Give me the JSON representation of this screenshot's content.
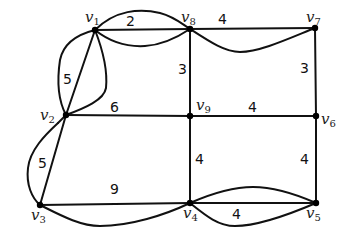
{
  "diagram": {
    "type": "weighted-graph",
    "nodes": [
      {
        "id": "v1",
        "letter": "v",
        "sub": "1",
        "x": 95,
        "y": 30
      },
      {
        "id": "v2",
        "letter": "v",
        "sub": "2",
        "x": 66,
        "y": 115
      },
      {
        "id": "v3",
        "letter": "v",
        "sub": "3",
        "x": 40,
        "y": 205
      },
      {
        "id": "v4",
        "letter": "v",
        "sub": "4",
        "x": 190,
        "y": 203
      },
      {
        "id": "v5",
        "letter": "v",
        "sub": "5",
        "x": 316,
        "y": 203
      },
      {
        "id": "v6",
        "letter": "v",
        "sub": "6",
        "x": 316,
        "y": 116
      },
      {
        "id": "v7",
        "letter": "v",
        "sub": "7",
        "x": 315,
        "y": 28
      },
      {
        "id": "v8",
        "letter": "v",
        "sub": "8",
        "x": 190,
        "y": 29
      },
      {
        "id": "v9",
        "letter": "v",
        "sub": "9",
        "x": 190,
        "y": 116
      }
    ],
    "edges": [
      {
        "from": "v1",
        "to": "v8",
        "weight": "2",
        "style": "straight"
      },
      {
        "from": "v1",
        "to": "v8",
        "weight": "",
        "style": "curve-up"
      },
      {
        "from": "v1",
        "to": "v8",
        "weight": "",
        "style": "curve-down"
      },
      {
        "from": "v8",
        "to": "v7",
        "weight": "4",
        "style": "straight"
      },
      {
        "from": "v8",
        "to": "v7",
        "weight": "",
        "style": "curve-down"
      },
      {
        "from": "v1",
        "to": "v2",
        "weight": "5",
        "style": "straight"
      },
      {
        "from": "v1",
        "to": "v2",
        "weight": "",
        "style": "curve-left"
      },
      {
        "from": "v1",
        "to": "v2",
        "weight": "",
        "style": "curve-right"
      },
      {
        "from": "v2",
        "to": "v9",
        "weight": "6",
        "style": "straight"
      },
      {
        "from": "v9",
        "to": "v6",
        "weight": "4",
        "style": "straight"
      },
      {
        "from": "v8",
        "to": "v9",
        "weight": "3",
        "style": "straight"
      },
      {
        "from": "v7",
        "to": "v6",
        "weight": "3",
        "style": "straight"
      },
      {
        "from": "v2",
        "to": "v3",
        "weight": "5",
        "style": "straight"
      },
      {
        "from": "v2",
        "to": "v3",
        "weight": "",
        "style": "curve-left"
      },
      {
        "from": "v3",
        "to": "v4",
        "weight": "9",
        "style": "straight"
      },
      {
        "from": "v3",
        "to": "v4",
        "weight": "",
        "style": "curve-down"
      },
      {
        "from": "v9",
        "to": "v4",
        "weight": "4",
        "style": "straight"
      },
      {
        "from": "v6",
        "to": "v5",
        "weight": "4",
        "style": "straight"
      },
      {
        "from": "v4",
        "to": "v5",
        "weight": "",
        "style": "straight"
      },
      {
        "from": "v4",
        "to": "v5",
        "weight": "",
        "style": "curve-up"
      },
      {
        "from": "v4",
        "to": "v5",
        "weight": "4",
        "style": "curve-down"
      }
    ],
    "weight_labels": {
      "w_v1v8": "2",
      "w_v8v7": "4",
      "w_v1v2": "5",
      "w_v2v9": "6",
      "w_v9v6": "4",
      "w_v8v9": "3",
      "w_v7v6": "3",
      "w_v2v3": "5",
      "w_v3v4": "9",
      "w_v9v4": "4",
      "w_v6v5": "4",
      "w_v4v5": "4"
    },
    "node_labels": {
      "v1": {
        "letter": "v",
        "sub": "1"
      },
      "v2": {
        "letter": "v",
        "sub": "2"
      },
      "v3": {
        "letter": "v",
        "sub": "3"
      },
      "v4": {
        "letter": "v",
        "sub": "4"
      },
      "v5": {
        "letter": "v",
        "sub": "5"
      },
      "v6": {
        "letter": "v",
        "sub": "6"
      },
      "v7": {
        "letter": "v",
        "sub": "7"
      },
      "v8": {
        "letter": "v",
        "sub": "8"
      },
      "v9": {
        "letter": "v",
        "sub": "9"
      }
    },
    "colors": {
      "edge": "#111111",
      "node": "#000000",
      "background": "#ffffff"
    }
  }
}
